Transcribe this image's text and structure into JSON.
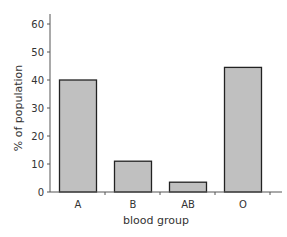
{
  "chart_data": {
    "type": "bar",
    "title": "",
    "xlabel": "blood group",
    "ylabel": "% of population",
    "categories": [
      "A",
      "B",
      "AB",
      "O"
    ],
    "values": [
      40,
      11,
      3.5,
      44.5
    ],
    "ylim": [
      0,
      65
    ],
    "yticks": [
      0,
      10,
      20,
      30,
      40,
      50,
      60
    ],
    "grid": false,
    "legend": null,
    "bar_color": "#c0c0c0",
    "bar_edge_color": "#222222"
  }
}
